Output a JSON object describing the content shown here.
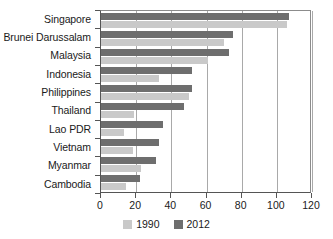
{
  "chart_data": {
    "type": "bar",
    "orientation": "horizontal",
    "title": "",
    "subtitle": "",
    "xlabel": "",
    "ylabel": "",
    "xlim": [
      0,
      120
    ],
    "ylim": null,
    "grid": true,
    "grid_axis": "x",
    "legend_position": "bottom",
    "xticks": [
      0,
      20,
      40,
      60,
      80,
      100,
      120
    ],
    "xtick_labels": [
      "0",
      "20",
      "40",
      "60",
      "80",
      "100",
      "120"
    ],
    "categories": [
      "Singapore",
      "Brunei Darussalam",
      "Malaysia",
      "Indonesia",
      "Philippines",
      "Thailand",
      "Lao PDR",
      "Vietnam",
      "Myanmar",
      "Cambodia"
    ],
    "series": [
      {
        "name": "1990",
        "color": "#c9c9c9",
        "values": [
          106,
          70,
          61,
          33,
          50,
          19,
          13,
          18,
          23,
          14
        ]
      },
      {
        "name": "2012",
        "color": "#6e6e6e",
        "values": [
          107,
          75,
          73,
          52,
          52,
          47,
          35,
          33,
          31,
          22
        ]
      }
    ],
    "series_draw_order": [
      "2012",
      "1990"
    ]
  },
  "legend": {
    "items": [
      {
        "label": "1990",
        "swatch": "s1990"
      },
      {
        "label": "2012",
        "swatch": "s2012"
      }
    ]
  }
}
